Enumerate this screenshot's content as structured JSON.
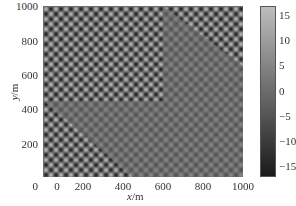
{
  "chart_data": {
    "type": "heatmap",
    "title": "",
    "xlabel": "x/m",
    "ylabel": "y/m",
    "xlim": [
      0,
      1000
    ],
    "ylim": [
      0,
      1000
    ],
    "xticks": [
      0,
      200,
      400,
      600,
      800,
      1000
    ],
    "yticks": [
      0,
      200,
      400,
      600,
      800,
      1000
    ],
    "grid": false,
    "colormap": "gray",
    "colorbar": {
      "position": "right",
      "range": [
        -17,
        17
      ],
      "ticks": [
        15,
        10,
        5,
        0,
        -5,
        -10,
        -15
      ]
    },
    "pattern": {
      "cells_x": 40,
      "cells_y": 34,
      "amplitude": 15,
      "low_contrast_regions": [
        {
          "corner": "upper-right",
          "boundary": [
            [
              600,
              1000
            ],
            [
              1000,
              650
            ]
          ]
        },
        {
          "corner": "lower-left",
          "boundary": [
            [
              0,
              450
            ],
            [
              450,
              0
            ]
          ]
        }
      ]
    }
  },
  "axes": {
    "xlabel_var": "x",
    "xlabel_unit": "/m",
    "ylabel_var": "y",
    "ylabel_unit": "/m",
    "xtick_labels": [
      "0",
      "200",
      "400",
      "600",
      "800",
      "1000"
    ],
    "ytick_labels": [
      "1000",
      "800",
      "600",
      "400",
      "200",
      "0"
    ],
    "colorbar_tick_labels": [
      "15",
      "10",
      "5",
      "0",
      "−15",
      "−10",
      "−5"
    ],
    "colorbar_labels_ordered": [
      "15",
      "10",
      "5",
      "0",
      "−5",
      "−10",
      "−15"
    ]
  },
  "colors": {
    "colorbar_top": "#bdbdbd",
    "colorbar_bottom": "#1a1a1a",
    "background": "#ffffff"
  }
}
